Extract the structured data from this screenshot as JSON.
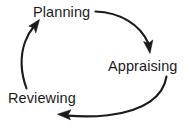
{
  "diagram": {
    "type": "cyclical-process",
    "background_color": "#ffffff",
    "stroke_color": "#1b1b1b",
    "text_color": "#1b1b1b",
    "direction": "clockwise",
    "nodes": [
      {
        "id": "planning",
        "label": "Planning",
        "x": 33,
        "y": 5
      },
      {
        "id": "appraising",
        "label": "Appraising",
        "x": 108,
        "y": 59
      },
      {
        "id": "reviewing",
        "label": "Reviewing",
        "x": 8,
        "y": 91
      }
    ],
    "arrows": [
      {
        "id": "planning-to-appraising",
        "from": "planning",
        "to": "appraising",
        "name": "arrow-planning-to-appraising"
      },
      {
        "id": "appraising-to-reviewing",
        "from": "appraising",
        "to": "reviewing",
        "name": "arrow-appraising-to-reviewing"
      },
      {
        "id": "reviewing-to-planning",
        "from": "reviewing",
        "to": "planning",
        "name": "arrow-reviewing-to-planning"
      }
    ]
  }
}
